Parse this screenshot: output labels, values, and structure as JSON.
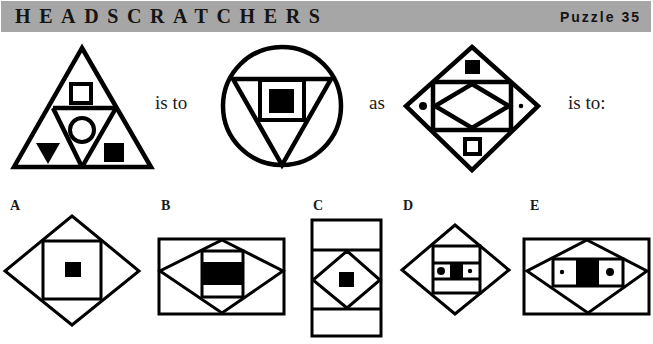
{
  "header": {
    "title": "HEADSCRATCHERS",
    "puzzle_label": "Puzzle 35",
    "background_color": "#a6a6a6"
  },
  "analogy": {
    "connector_1": "is to",
    "connector_2": "as",
    "connector_3": "is to:",
    "figures": [
      {
        "id": "figure-1",
        "description": "Triangle divided into four sub-triangles: hollow square (top), hollow circle (center), filled inverted triangle (bottom-left), filled square (bottom-right)"
      },
      {
        "id": "figure-2",
        "description": "Circle enclosing an inverted triangle containing a hollow square with a filled square inside"
      },
      {
        "id": "figure-3",
        "description": "Diamond with inner rectangle containing a diamond; filled square (top), hollow square (bottom), filled dot (left), small dot (right)"
      }
    ]
  },
  "options": [
    {
      "label": "A",
      "description": "Diamond containing square with small filled square in center"
    },
    {
      "label": "B",
      "description": "Rectangle containing diamond containing rectangle with filled band"
    },
    {
      "label": "C",
      "description": "Tall rectangle split in three, middle section has diamond with filled square"
    },
    {
      "label": "D",
      "description": "Diamond containing square with band showing large dot, filled square, small dot"
    },
    {
      "label": "E",
      "description": "Rectangle containing diamond with inner rectangle: small dot, filled block, large dot"
    }
  ],
  "colors": {
    "ink": "#000000",
    "paper": "#ffffff"
  }
}
